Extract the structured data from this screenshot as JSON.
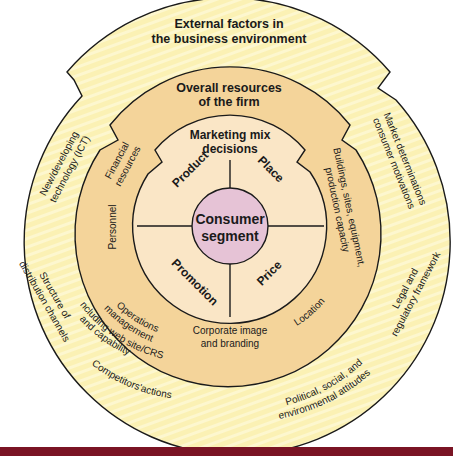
{
  "diagram": {
    "colors": {
      "outer_ring": "#fbf1b4",
      "outer_stripe": "#fdf7cf",
      "middle_ring": "#f4d49a",
      "inner_circle": "#fae6c6",
      "core_circle": "#e6c3d6",
      "outline": "#1a1a1a",
      "footer_bar": "#7a1424"
    },
    "outer_ring": {
      "title_line1": "External factors in",
      "title_line2": "the business environment",
      "labels": {
        "ict_line1": "New/developing",
        "ict_line2": "technology (ICT)",
        "market_line1": "Market determinations",
        "market_line2": "consumer motivations",
        "distribution_line1": "Structure of",
        "distribution_line2": "distribution channels",
        "legal_line1": "Legal and",
        "legal_line2": "regulatory framework",
        "competitors": "Competitors'actions",
        "political_line1": "Political, social, and",
        "political_line2": "environmental attitudes"
      }
    },
    "middle_ring": {
      "title_line1": "Overall resources",
      "title_line2": "of the firm",
      "labels": {
        "financial_line1": "Financial",
        "financial_line2": "resources",
        "personnel": "Personnel",
        "operations_line1": "Operations",
        "operations_line2": "management",
        "operations_line3": "including web site/CRS",
        "operations_line4": "and capability",
        "buildings_line1": "Buildings, sites, equipment,",
        "buildings_line2": "production capacity",
        "location": "Location",
        "corporate_line1": "Corporate image",
        "corporate_line2": "and branding"
      }
    },
    "inner_circle": {
      "title_line1": "Marketing mix",
      "title_line2": "decisions",
      "quadrants": {
        "product": "Product",
        "place": "Place",
        "promotion": "Promotion",
        "price": "Price"
      }
    },
    "core": {
      "line1": "Consumer",
      "line2": "segment"
    }
  }
}
